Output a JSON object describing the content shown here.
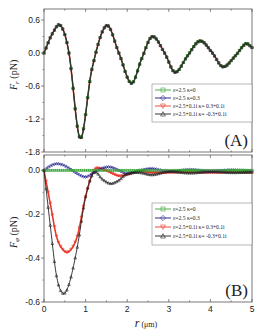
{
  "chart_data": [
    {
      "type": "line",
      "panel_label": "(A)",
      "ylabel": "F_r (pN)",
      "xlabel": "",
      "xlim": [
        0,
        5
      ],
      "ylim": [
        -1.8,
        0.8
      ],
      "yticks": [
        "0.6",
        "0.0",
        "-0.6",
        "-1.2",
        "-1.8"
      ],
      "ytick_values": [
        0.6,
        0.0,
        -0.6,
        -1.2,
        -1.8
      ],
      "grid": false,
      "legend_position": "center-right",
      "legend": [
        {
          "label": "ε=2.5  κ=0",
          "color": "#3aa63a",
          "marker": "square"
        },
        {
          "label": "ε=2.5  κ=0.3",
          "color": "#1a1a8c",
          "marker": "diamond"
        },
        {
          "label": "ε=2.5+0.1i  κ= 0.3+0.1i",
          "color": "#e8392b",
          "marker": "triangle-down"
        },
        {
          "label": "ε=2.5+0.1i  κ= -0.3+0.1i",
          "color": "#222222",
          "marker": "triangle-up"
        }
      ],
      "x": [
        0,
        0.2,
        0.4,
        0.6,
        0.87,
        1.15,
        1.5,
        1.8,
        2.1,
        2.35,
        2.6,
        2.9,
        3.15,
        3.45,
        3.75,
        4.05,
        4.3,
        4.6,
        4.85,
        5.0
      ],
      "series": [
        {
          "name": "ε=2.5 κ=0",
          "values": [
            0.0,
            0.35,
            0.5,
            0.0,
            -1.55,
            -0.3,
            0.5,
            0.0,
            -0.55,
            -0.1,
            0.3,
            0.0,
            -0.35,
            -0.05,
            0.22,
            0.0,
            -0.25,
            -0.05,
            0.17,
            0.1
          ]
        },
        {
          "name": "ε=2.5 κ=0.3",
          "values": [
            0.0,
            0.35,
            0.5,
            0.0,
            -1.55,
            -0.3,
            0.5,
            0.0,
            -0.55,
            -0.1,
            0.3,
            0.0,
            -0.35,
            -0.05,
            0.22,
            0.0,
            -0.25,
            -0.05,
            0.17,
            0.1
          ]
        },
        {
          "name": "ε=2.5+0.1i κ=0.3+0.1i",
          "values": [
            0.0,
            0.35,
            0.5,
            0.0,
            -1.55,
            -0.3,
            0.5,
            0.0,
            -0.55,
            -0.1,
            0.3,
            0.0,
            -0.35,
            -0.05,
            0.22,
            0.0,
            -0.25,
            -0.05,
            0.17,
            0.1
          ]
        },
        {
          "name": "ε=2.5+0.1i κ=-0.3+0.1i",
          "values": [
            0.0,
            0.35,
            0.5,
            0.0,
            -1.55,
            -0.3,
            0.5,
            0.0,
            -0.55,
            -0.1,
            0.3,
            0.0,
            -0.35,
            -0.05,
            0.22,
            0.0,
            -0.25,
            -0.05,
            0.17,
            0.1
          ]
        }
      ]
    },
    {
      "type": "line",
      "panel_label": "(B)",
      "ylabel": "F_φ (pN)",
      "xlabel": "r (μm)",
      "xlim": [
        0,
        5
      ],
      "ylim": [
        -0.6,
        0.07
      ],
      "xticks": [
        "0",
        "1",
        "2",
        "3",
        "4",
        "5"
      ],
      "yticks": [
        "0.0",
        "-0.2",
        "-0.4",
        "-0.6"
      ],
      "ytick_values": [
        0.0,
        -0.2,
        -0.4,
        -0.6
      ],
      "grid": false,
      "legend_position": "center-right",
      "legend": [
        {
          "label": "ε=2.5  κ=0",
          "color": "#3aa63a",
          "marker": "square"
        },
        {
          "label": "ε=2.5  κ=0.3",
          "color": "#1a1a8c",
          "marker": "diamond"
        },
        {
          "label": "ε=2.5+0.1i  κ= 0.3+0.1i",
          "color": "#e8392b",
          "marker": "triangle-down"
        },
        {
          "label": "ε=2.5+0.1i  κ= -0.3+0.1i",
          "color": "#222222",
          "marker": "triangle-up"
        }
      ],
      "x": [
        0,
        0.15,
        0.3,
        0.45,
        0.6,
        0.8,
        1.0,
        1.2,
        1.4,
        1.6,
        1.8,
        2.0,
        2.3,
        2.6,
        3.0,
        3.5,
        4.0,
        4.5,
        5.0
      ],
      "series": [
        {
          "name": "ε=2.5 κ=0",
          "values": [
            0,
            0,
            0,
            0,
            0,
            0,
            0,
            0,
            0,
            0,
            0,
            0,
            0,
            0,
            0,
            0,
            0,
            0,
            0
          ]
        },
        {
          "name": "ε=2.5 κ=0.3",
          "values": [
            0,
            0.02,
            0.03,
            0.025,
            0.01,
            -0.015,
            -0.03,
            -0.01,
            0.01,
            0.015,
            0.0,
            -0.015,
            0.0,
            0.008,
            -0.005,
            0.004,
            -0.004,
            0.002,
            -0.002
          ]
        },
        {
          "name": "ε=2.5+0.1i κ=0.3+0.1i",
          "values": [
            0,
            -0.15,
            -0.3,
            -0.36,
            -0.37,
            -0.3,
            -0.12,
            0.0,
            0.005,
            -0.01,
            -0.025,
            -0.02,
            -0.005,
            -0.01,
            -0.01,
            -0.008,
            -0.01,
            -0.008,
            -0.01
          ]
        },
        {
          "name": "ε=2.5+0.1i κ=-0.3+0.1i",
          "values": [
            0,
            -0.25,
            -0.48,
            -0.56,
            -0.52,
            -0.35,
            -0.12,
            -0.01,
            -0.04,
            -0.06,
            -0.045,
            -0.015,
            -0.01,
            -0.02,
            -0.005,
            -0.012,
            -0.006,
            -0.01,
            -0.008
          ]
        }
      ]
    }
  ]
}
